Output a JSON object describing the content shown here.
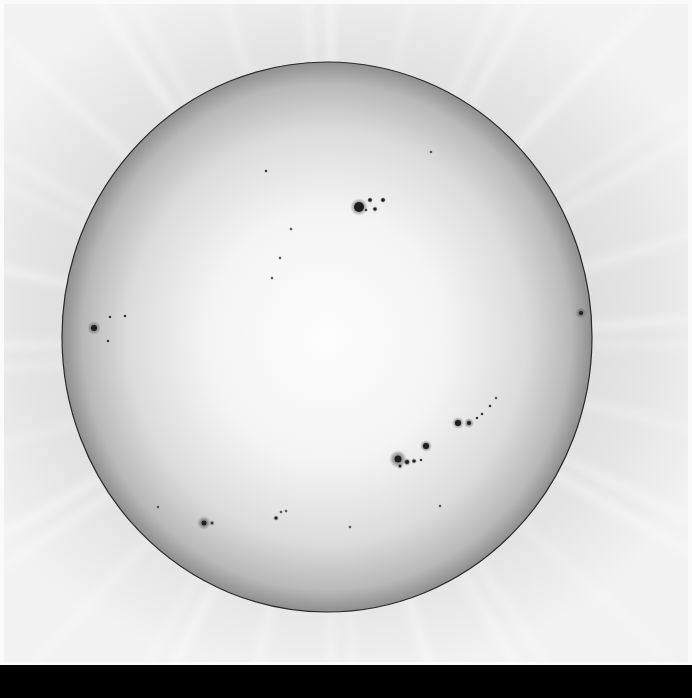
{
  "image": {
    "subject": "Solar disk in white light with sunspot groups",
    "width": 692,
    "height": 698,
    "colors": {
      "background_sky": "#e4e4e4",
      "frame": "#fafafa",
      "disk_center": "#fbfbfb",
      "disk_limb": "#8f8f8f",
      "limb_line": "#2a2a2a",
      "sunspot_umbra": "#1e1e1e",
      "sunspot_penumbra": "#6a6a6a",
      "bottom_bar": "#000000"
    },
    "disk": {
      "cx": 327,
      "cy": 337,
      "rx": 265,
      "ry": 275
    },
    "sunspot_groups": [
      {
        "name": "north-central-group",
        "spots": [
          {
            "x": 359,
            "y": 207,
            "r": 5,
            "pen": 9
          },
          {
            "x": 370,
            "y": 200,
            "r": 1.8,
            "pen": 3
          },
          {
            "x": 375,
            "y": 209,
            "r": 1.6,
            "pen": 3
          },
          {
            "x": 383,
            "y": 200,
            "r": 1.8,
            "pen": 3
          },
          {
            "x": 366,
            "y": 210,
            "r": 1,
            "pen": 2
          }
        ]
      },
      {
        "name": "east-limb-group",
        "spots": [
          {
            "x": 94,
            "y": 328,
            "r": 3,
            "pen": 7
          },
          {
            "x": 110,
            "y": 317,
            "r": 1,
            "pen": 2
          },
          {
            "x": 125,
            "y": 316,
            "r": 1,
            "pen": 2
          },
          {
            "x": 108,
            "y": 341,
            "r": 1,
            "pen": 2
          }
        ]
      },
      {
        "name": "south-central-group",
        "spots": [
          {
            "x": 398,
            "y": 459,
            "r": 3.5,
            "pen": 9
          },
          {
            "x": 426,
            "y": 446,
            "r": 3,
            "pen": 6
          },
          {
            "x": 407,
            "y": 462,
            "r": 2,
            "pen": 4
          },
          {
            "x": 414,
            "y": 461,
            "r": 1.6,
            "pen": 3
          },
          {
            "x": 400,
            "y": 466,
            "r": 1.2,
            "pen": 3
          },
          {
            "x": 421,
            "y": 460,
            "r": 1,
            "pen": 2
          }
        ]
      },
      {
        "name": "south-west-chain",
        "spots": [
          {
            "x": 458,
            "y": 423,
            "r": 3,
            "pen": 6
          },
          {
            "x": 469,
            "y": 423,
            "r": 2,
            "pen": 5
          },
          {
            "x": 477,
            "y": 418,
            "r": 1,
            "pen": 2
          },
          {
            "x": 482,
            "y": 414,
            "r": 1,
            "pen": 2
          },
          {
            "x": 490,
            "y": 406,
            "r": 1,
            "pen": 2
          },
          {
            "x": 496,
            "y": 398,
            "r": 0.8,
            "pen": 2
          }
        ]
      },
      {
        "name": "south-east-group",
        "spots": [
          {
            "x": 204,
            "y": 523,
            "r": 2.5,
            "pen": 7
          },
          {
            "x": 212,
            "y": 523,
            "r": 1,
            "pen": 3
          },
          {
            "x": 276,
            "y": 518,
            "r": 1.5,
            "pen": 3
          },
          {
            "x": 281,
            "y": 512,
            "r": 0.8,
            "pen": 2
          },
          {
            "x": 286,
            "y": 511,
            "r": 0.8,
            "pen": 2
          }
        ]
      },
      {
        "name": "west-limb-facula-group",
        "spots": [
          {
            "x": 581,
            "y": 313,
            "r": 2,
            "pen": 6
          }
        ]
      },
      {
        "name": "scattered-pores",
        "spots": [
          {
            "x": 266,
            "y": 171,
            "r": 1,
            "pen": 2
          },
          {
            "x": 291,
            "y": 229,
            "r": 0.8,
            "pen": 2
          },
          {
            "x": 280,
            "y": 258,
            "r": 0.8,
            "pen": 2
          },
          {
            "x": 272,
            "y": 278,
            "r": 0.8,
            "pen": 2
          },
          {
            "x": 431,
            "y": 152,
            "r": 0.8,
            "pen": 2
          },
          {
            "x": 440,
            "y": 506,
            "r": 0.8,
            "pen": 2
          },
          {
            "x": 158,
            "y": 507,
            "r": 0.8,
            "pen": 2
          },
          {
            "x": 350,
            "y": 527,
            "r": 0.8,
            "pen": 2
          }
        ]
      }
    ]
  }
}
